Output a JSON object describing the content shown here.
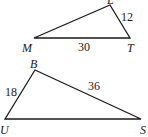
{
  "triangles": [
    {
      "name": "triangle-LMT",
      "vertices": {
        "top": "L",
        "left": "M",
        "right": "T"
      },
      "sides": {
        "MT": "30",
        "LT": "12"
      }
    },
    {
      "name": "triangle-BUS",
      "vertices": {
        "top": "B",
        "left": "U",
        "right": "S"
      },
      "sides": {
        "UB": "18",
        "BS": "36"
      }
    }
  ],
  "colors": {
    "stroke": "#1a1a1a",
    "background": "#ffffff"
  }
}
